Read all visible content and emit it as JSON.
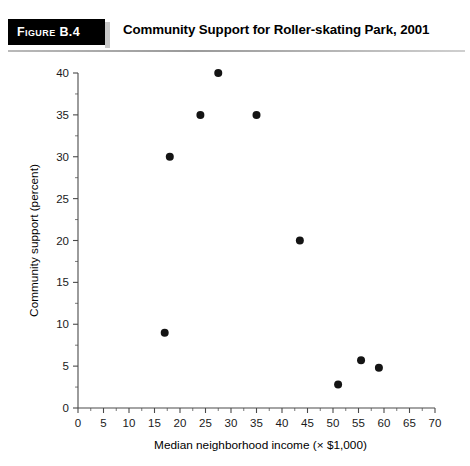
{
  "header": {
    "badge_label": "Figure B.4",
    "title": "Community Support for Roller-skating Park, 2001",
    "badge_color": "#000000",
    "badge_text_color": "#ffffff"
  },
  "chart_data": {
    "type": "scatter",
    "title": "Community Support for Roller-skating Park, 2001",
    "xlabel": "Median neighborhood income (× $1,000)",
    "ylabel": "Community support (percent)",
    "xlim": [
      0,
      70
    ],
    "ylim": [
      0,
      40
    ],
    "xticks": [
      0,
      5,
      10,
      15,
      20,
      25,
      30,
      35,
      40,
      45,
      50,
      55,
      60,
      65,
      70
    ],
    "yticks": [
      0,
      5,
      10,
      15,
      20,
      25,
      30,
      35,
      40
    ],
    "xtick_labels": [
      "0",
      "5",
      "10",
      "15",
      "20",
      "25",
      "30",
      "35",
      "40",
      "45",
      "50",
      "55",
      "60",
      "65",
      "70"
    ],
    "ytick_labels": [
      "0",
      "5",
      "10",
      "15",
      "20",
      "25",
      "30",
      "35",
      "40"
    ],
    "grid": false,
    "legend": false,
    "marker_color": "#141414",
    "marker_size": 4.0,
    "points": [
      {
        "x": 17,
        "y": 9
      },
      {
        "x": 18,
        "y": 30
      },
      {
        "x": 24,
        "y": 35
      },
      {
        "x": 27.5,
        "y": 40
      },
      {
        "x": 35,
        "y": 35
      },
      {
        "x": 43.5,
        "y": 20
      },
      {
        "x": 51,
        "y": 2.8
      },
      {
        "x": 55.5,
        "y": 5.7
      },
      {
        "x": 59,
        "y": 4.8
      }
    ]
  }
}
